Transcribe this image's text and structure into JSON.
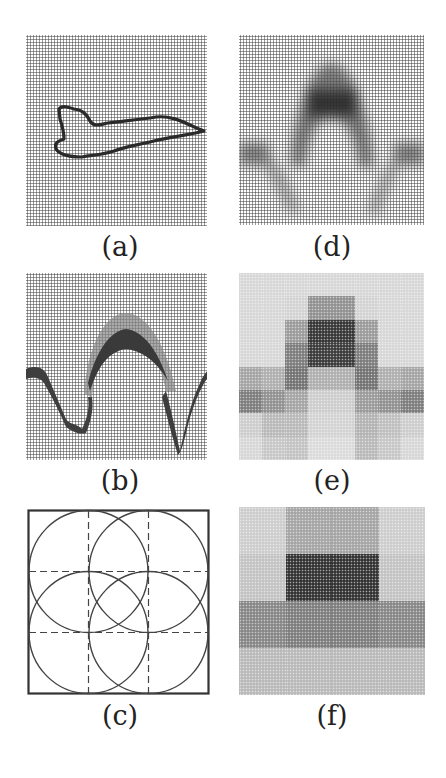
{
  "figure": {
    "panels": [
      {
        "id": "a",
        "label": "(a)",
        "description": "Airplane silhouette outline (edge map) on halftone background"
      },
      {
        "id": "b",
        "label": "(b)",
        "description": "Arch-shaped intensity band with two lower dips"
      },
      {
        "id": "c",
        "label": "(c)",
        "description": "Square frame divided by dashed lines into 3x3 grid with four overlapping ellipses"
      },
      {
        "id": "d",
        "label": "(d)",
        "description": "Blurred version of arch shape"
      },
      {
        "id": "e",
        "label": "(e)",
        "description": "8x8 block-averaged version"
      },
      {
        "id": "f",
        "label": "(f)",
        "description": "4x4 block-averaged version"
      }
    ],
    "grid_e": {
      "rows": 8,
      "cols": 8,
      "values": [
        [
          0.1,
          0.1,
          0.1,
          0.1,
          0.1,
          0.1,
          0.1,
          0.1
        ],
        [
          0.1,
          0.1,
          0.12,
          0.45,
          0.45,
          0.12,
          0.1,
          0.1
        ],
        [
          0.1,
          0.1,
          0.4,
          0.9,
          0.9,
          0.4,
          0.1,
          0.1
        ],
        [
          0.1,
          0.1,
          0.55,
          0.88,
          0.88,
          0.55,
          0.1,
          0.1
        ],
        [
          0.35,
          0.3,
          0.6,
          0.3,
          0.3,
          0.6,
          0.3,
          0.35
        ],
        [
          0.55,
          0.45,
          0.35,
          0.15,
          0.15,
          0.4,
          0.45,
          0.55
        ],
        [
          0.15,
          0.25,
          0.25,
          0.12,
          0.12,
          0.28,
          0.22,
          0.15
        ],
        [
          0.1,
          0.18,
          0.2,
          0.08,
          0.08,
          0.25,
          0.18,
          0.1
        ]
      ]
    },
    "grid_f": {
      "rows": 4,
      "cols": 4,
      "values": [
        [
          0.15,
          0.35,
          0.35,
          0.15
        ],
        [
          0.2,
          0.92,
          0.92,
          0.2
        ],
        [
          0.5,
          0.55,
          0.55,
          0.5
        ],
        [
          0.25,
          0.25,
          0.25,
          0.25
        ]
      ]
    }
  }
}
